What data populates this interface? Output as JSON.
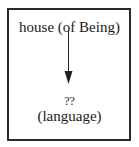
{
  "diagram": {
    "top_node": {
      "label": "house (of Being)"
    },
    "edge": {
      "direction": "down",
      "from": "house (of Being)",
      "to": "??"
    },
    "bottom_node": {
      "marker": "??",
      "label": "(language)"
    },
    "colors": {
      "border": "#2a2a2a",
      "text": "#1a1a1a",
      "arrow": "#222222",
      "background": "#ffffff"
    }
  }
}
